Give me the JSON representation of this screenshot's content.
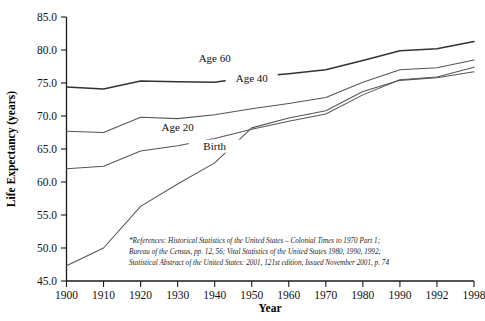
{
  "chart_data": {
    "type": "line",
    "title": "",
    "xlabel": "Year",
    "ylabel": "Life Expectancy (years)",
    "categories": [
      "1900",
      "1910",
      "1920",
      "1930",
      "1940",
      "1950",
      "1960",
      "1970",
      "1980",
      "1990",
      "1992",
      "1998"
    ],
    "ylim": [
      45.0,
      85.0
    ],
    "ytick_labels": [
      "45.0",
      "50.0",
      "55.0",
      "60.0",
      "65.0",
      "70.0",
      "75.0",
      "80.0",
      "85.0"
    ],
    "ytick_values": [
      45.0,
      50.0,
      55.0,
      60.0,
      65.0,
      70.0,
      75.0,
      80.0,
      85.0
    ],
    "grid": false,
    "legend_position": "inline-labels",
    "series": [
      {
        "name": "Age 60",
        "color": "#333333",
        "values": [
          74.4,
          74.1,
          75.3,
          75.2,
          75.1,
          75.9,
          76.4,
          77.0,
          78.4,
          79.9,
          80.2,
          81.3
        ]
      },
      {
        "name": "Age 40",
        "color": "#555555",
        "values": [
          67.7,
          67.5,
          69.8,
          69.6,
          70.2,
          71.1,
          71.9,
          72.8,
          75.1,
          77.0,
          77.3,
          78.5
        ]
      },
      {
        "name": "Age 20",
        "color": "#555555",
        "values": [
          62.0,
          62.4,
          64.7,
          65.5,
          66.6,
          68.0,
          69.2,
          70.3,
          73.2,
          75.5,
          75.9,
          77.4
        ]
      },
      {
        "name": "Birth",
        "color": "#555555",
        "values": [
          47.3,
          50.0,
          56.3,
          59.7,
          62.9,
          68.2,
          69.7,
          70.8,
          73.7,
          75.4,
          75.8,
          76.7
        ]
      }
    ],
    "series_labels": [
      {
        "text": "Age 60",
        "x_category": "1940",
        "y_value": 78.2
      },
      {
        "text": "Age 40",
        "x_category": "1950",
        "y_value": 75.2
      },
      {
        "text": "Age 20",
        "x_category": "1930",
        "y_value": 67.7
      },
      {
        "text": "Birth",
        "x_category": "1940",
        "y_value": 64.9
      }
    ],
    "footnote": [
      "*References: Historical Statistics of the United States – Colonial Times to 1970 Part 1;",
      "Bureau of the Census, pp. 12, 56; Vital Statistics of the United States 1980, 1990, 1992;",
      "Statistical Abstract of the United States: 2001, 121st edition, Issued November 2001, p. 74"
    ]
  }
}
